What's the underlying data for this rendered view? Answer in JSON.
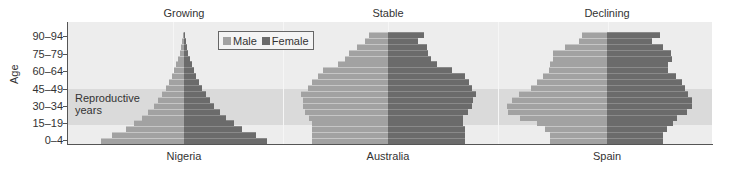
{
  "chart_data": {
    "type": "bar",
    "subtype": "population-pyramid",
    "ylabel": "Age",
    "age_groups": [
      "0-4",
      "5-9",
      "10-14",
      "15-19",
      "20-24",
      "25-29",
      "30-34",
      "35-39",
      "40-44",
      "45-49",
      "50-54",
      "55-59",
      "60-64",
      "65-69",
      "70-74",
      "75-79",
      "80-84",
      "85-89",
      "90-94"
    ],
    "ytick_labels": [
      "0–4",
      "15–19",
      "30–34",
      "45–49",
      "60–64",
      "75–79",
      "90–94"
    ],
    "legend": [
      {
        "name": "Male",
        "color": "#a2a2a2"
      },
      {
        "name": "Female",
        "color": "#6b6b6b"
      }
    ],
    "annotation": {
      "text_line1": "Reproductive",
      "text_line2": "years",
      "range": [
        "15-19",
        "45-49"
      ]
    },
    "units_note": "bar lengths are relative (pixel-estimated), no x-axis scale shown",
    "panels": [
      {
        "title": "Growing",
        "country": "Nigeria",
        "center_px": 184,
        "male": [
          83,
          72,
          58,
          50,
          42,
          36,
          30,
          26,
          22,
          18,
          15,
          12,
          10,
          8,
          6,
          4,
          3,
          2,
          1
        ],
        "female": [
          83,
          72,
          58,
          50,
          42,
          36,
          30,
          26,
          22,
          18,
          15,
          12,
          10,
          8,
          6,
          4,
          3,
          2,
          1
        ]
      },
      {
        "title": "Stable",
        "country": "Australia",
        "center_px": 388,
        "male": [
          76,
          76,
          76,
          76,
          79,
          83,
          85,
          85,
          87,
          80,
          76,
          70,
          65,
          50,
          43,
          39,
          31,
          23,
          19
        ],
        "female": [
          77,
          77,
          77,
          75,
          75,
          80,
          84,
          85,
          88,
          84,
          81,
          77,
          64,
          49,
          43,
          40,
          39,
          30,
          36
        ]
      },
      {
        "title": "Declining",
        "country": "Spain",
        "center_px": 607,
        "male": [
          57,
          57,
          62,
          70,
          87,
          99,
          100,
          95,
          88,
          76,
          70,
          64,
          58,
          57,
          54,
          54,
          42,
          28,
          25
        ],
        "female": [
          56,
          56,
          60,
          66,
          70,
          80,
          85,
          85,
          81,
          78,
          75,
          69,
          61,
          61,
          65,
          64,
          56,
          45,
          53
        ]
      }
    ]
  },
  "labels": {
    "ylabel": "Age",
    "ticks": [
      "0–4",
      "15–19",
      "30–34",
      "45–49",
      "60–64",
      "75–79",
      "90–94"
    ],
    "legend_male": "Male",
    "legend_female": "Female",
    "repro_line1": "Reproductive",
    "repro_line2": "years",
    "panels": [
      {
        "title": "Growing",
        "country": "Nigeria"
      },
      {
        "title": "Stable",
        "country": "Australia"
      },
      {
        "title": "Declining",
        "country": "Spain"
      }
    ]
  }
}
